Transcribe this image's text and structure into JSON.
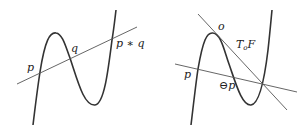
{
  "figures": [
    {
      "name": "point-addition",
      "labels": {
        "p": "p",
        "q": "q",
        "sum": "p ∗ q"
      }
    },
    {
      "name": "tangent-negation",
      "labels": {
        "o": "o",
        "tangent": "T",
        "tangent_sub": "o",
        "tangent_F": "F",
        "p": "p",
        "neg_p": "⊖p"
      }
    }
  ],
  "colors": {
    "curve": "#333333",
    "line": "#555555",
    "text": "#222222",
    "background": "#ffffff"
  }
}
